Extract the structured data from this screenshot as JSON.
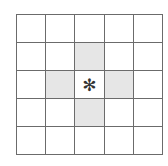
{
  "grid": {
    "rows": 5,
    "cols": 5,
    "shaded_color": "#e6e6e6",
    "line_color": "#6b6b6b",
    "shaded_cells": [
      [
        1,
        2
      ],
      [
        2,
        1
      ],
      [
        2,
        3
      ],
      [
        3,
        2
      ]
    ],
    "marked_cell": [
      2,
      2
    ],
    "mark_symbol": "✻"
  }
}
